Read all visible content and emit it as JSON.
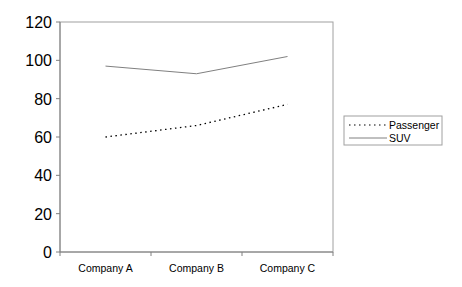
{
  "chart_data": {
    "type": "line",
    "title": "",
    "xlabel": "",
    "ylabel": "",
    "categories": [
      "Company A",
      "Company B",
      "Company C"
    ],
    "series": [
      {
        "name": "Passenger",
        "values": [
          60,
          66,
          77
        ],
        "style": "dotted",
        "color": "#000000"
      },
      {
        "name": "SUV",
        "values": [
          97,
          93,
          102
        ],
        "style": "solid",
        "color": "#808080"
      }
    ],
    "ylim": [
      0,
      120
    ],
    "yticks": [
      "0",
      "20",
      "40",
      "60",
      "80",
      "100",
      "120"
    ],
    "grid": false,
    "legend_position": "right"
  },
  "legend": {
    "items": [
      "Passenger",
      "SUV"
    ]
  }
}
